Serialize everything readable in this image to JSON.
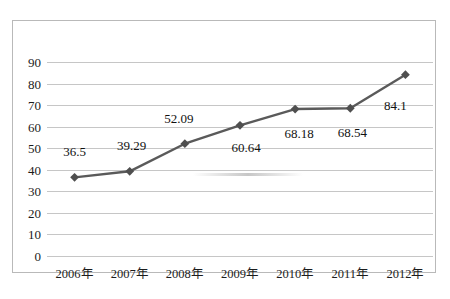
{
  "chart_data": {
    "type": "line",
    "title": "",
    "subtitle": "",
    "xlabel": "",
    "ylabel": "",
    "categories": [
      "2006年",
      "2007年",
      "2008年",
      "2009年",
      "2010年",
      "2011年",
      "2012年"
    ],
    "values": [
      36.5,
      39.29,
      52.09,
      60.64,
      68.18,
      68.54,
      84.1
    ],
    "point_labels": [
      "36.5",
      "39.29",
      "52.09",
      "60.64",
      "68.18",
      "68.54",
      "84.1"
    ],
    "ylim": [
      0,
      90
    ],
    "ytick_values": [
      0,
      10,
      20,
      30,
      40,
      50,
      60,
      70,
      80,
      90
    ],
    "ytick_labels": [
      "0",
      "10",
      "20",
      "30",
      "40",
      "50",
      "60",
      "70",
      "80",
      "90"
    ],
    "grid": true,
    "grid_axis": "y",
    "legend": false,
    "legend_position": "none",
    "marker": "diamond",
    "series": [
      {
        "name": "series-1",
        "values": [
          36.5,
          39.29,
          52.09,
          60.64,
          68.18,
          68.54,
          84.1
        ]
      }
    ]
  },
  "style": {
    "line_color": "#5a5a5a",
    "marker_color": "#4f4f4f",
    "grid_color": "#c6c6c6",
    "border_color": "#b9b9b9",
    "text_color": "#1c1c1c",
    "background": "#ffffff"
  },
  "label_offsets": [
    {
      "dx": 0,
      "dy": -26
    },
    {
      "dx": 2,
      "dy": -26
    },
    {
      "dx": -6,
      "dy": -26
    },
    {
      "dx": 6,
      "dy": 22
    },
    {
      "dx": 4,
      "dy": 24
    },
    {
      "dx": 2,
      "dy": 24
    },
    {
      "dx": -10,
      "dy": 30
    }
  ]
}
